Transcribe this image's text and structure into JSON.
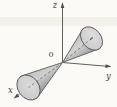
{
  "figure": {
    "type": "3d-diagram",
    "axis_labels": {
      "x": "x",
      "y": "y",
      "z": "z"
    },
    "origin_label": "0",
    "colors": {
      "background": "#fbfaf7",
      "axis_line": "#4d4d4d",
      "cone_outline": "#5a5a5a",
      "cone_body_light": "#d2d2d2",
      "cone_body_mid": "#b4b4b4",
      "cone_body_dark": "#8f8f8f",
      "ellipse_face": "#d6d6d6",
      "ellipse_rim": "#b0b0b0",
      "hidden_axis_dash": "#6f6f6f",
      "label_text": "#3c3c3c",
      "scan_band": "#ece7db"
    }
  }
}
